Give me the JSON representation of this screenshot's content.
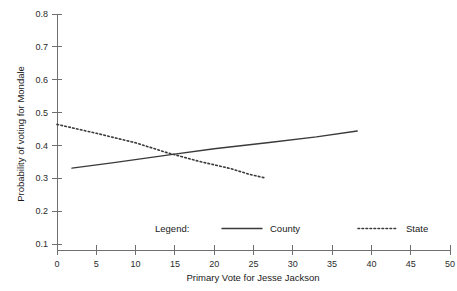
{
  "figure": {
    "title_clipped": "",
    "background_color": "#ffffff",
    "ink_color": "#3a3a3a",
    "axis_color": "#6f6f6f"
  },
  "axes": {
    "x": {
      "label": "Primary Vote for Jesse Jackson",
      "ticks": [
        "0",
        "5",
        "10",
        "15",
        "20",
        "25",
        "30",
        "35",
        "40",
        "45",
        "50"
      ],
      "min": 0,
      "max": 50,
      "step": 5
    },
    "y": {
      "label": "Probability of voting for Mondale",
      "ticks": [
        "0.1",
        "0.2",
        "0.3",
        "0.4",
        "0.5",
        "0.6",
        "0.7",
        "0.8"
      ],
      "min": 0.1,
      "max": 0.8,
      "step": 0.1
    }
  },
  "legend": {
    "title": "Legend:",
    "entries": [
      {
        "label": "County",
        "style": "solid"
      },
      {
        "label": "State",
        "style": "dotted"
      }
    ]
  },
  "chart_data": {
    "type": "line",
    "title": "",
    "xlabel": "Primary Vote for Jesse Jackson",
    "ylabel": "Probability of voting for Mondale",
    "xlim": [
      0,
      50
    ],
    "ylim": [
      0.1,
      0.8
    ],
    "xticks": [
      0,
      5,
      10,
      15,
      20,
      25,
      30,
      35,
      40,
      45,
      50
    ],
    "yticks": [
      0.1,
      0.2,
      0.3,
      0.4,
      0.5,
      0.6,
      0.7,
      0.8
    ],
    "grid": false,
    "legend_position": "inside-bottom",
    "series": [
      {
        "name": "County",
        "style": "solid",
        "color": "#3a3a3a",
        "x": [
          1.9,
          7.0,
          14.5,
          20.0,
          27.0,
          33.0,
          38.2
        ],
        "y": [
          0.331,
          0.347,
          0.372,
          0.39,
          0.409,
          0.426,
          0.444
        ]
      },
      {
        "name": "State",
        "style": "dotted",
        "color": "#3a3a3a",
        "x": [
          0.0,
          5.0,
          10.0,
          14.0,
          18.0,
          22.0,
          24.5,
          26.5
        ],
        "y": [
          0.464,
          0.437,
          0.408,
          0.378,
          0.352,
          0.33,
          0.312,
          0.301
        ]
      }
    ]
  }
}
